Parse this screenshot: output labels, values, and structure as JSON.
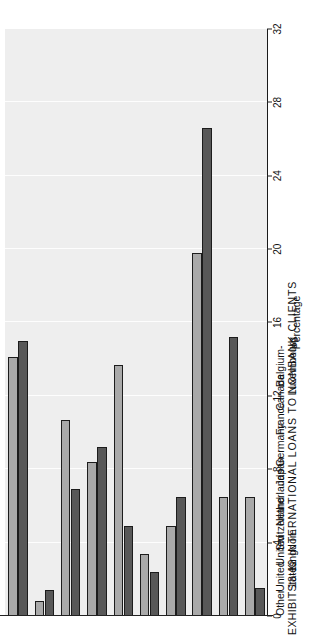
{
  "exhibit": {
    "number": "EXHIBIT  18-12",
    "title": "INTERNATIONAL  LOANS  TO  NONBANK  CLIENTS"
  },
  "axis_title": "Percentage",
  "legend": {
    "entries": [
      {
        "label": "1990",
        "color": "#a9a9a9"
      },
      {
        "label": "1975",
        "color": "#585858"
      }
    ]
  },
  "chart_data": {
    "type": "bar",
    "orientation": "horizontal",
    "title": "EXHIBIT  18-12  INTERNATIONAL  LOANS  TO  NONBANK  CLIENTS",
    "xlabel": "",
    "ylabel": "Percentage",
    "ylim": [
      0,
      32
    ],
    "ticks": [
      32,
      28,
      24,
      20,
      16,
      12,
      8,
      4,
      0
    ],
    "grid": true,
    "legend_position": "right",
    "categories": [
      "Belgium-\nLuxembourg",
      "Canada",
      "France",
      "Germany",
      "Japan",
      "Netherlands",
      "Switzerland",
      "United\nKingdom",
      "United\nStates",
      "Other"
    ],
    "series": [
      {
        "name": "1975",
        "color": "#585858",
        "values": [
          15.0,
          1.4,
          6.9,
          9.2,
          4.9,
          2.4,
          6.5,
          26.6,
          15.2,
          1.5
        ]
      },
      {
        "name": "1990",
        "color": "#a9a9a9",
        "values": [
          14.1,
          0.8,
          10.7,
          8.4,
          13.7,
          3.4,
          4.9,
          19.8,
          6.5,
          6.5
        ]
      }
    ]
  }
}
